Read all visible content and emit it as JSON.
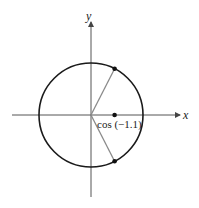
{
  "diagram": {
    "type": "unit-circle",
    "axes": {
      "x_label": "x",
      "y_label": "y"
    },
    "circle": {
      "center": [
        0,
        0
      ],
      "radius": 1
    },
    "points": [
      {
        "name": "upper-point",
        "angle": 1.1,
        "description": "point on circle at angle 1.1"
      },
      {
        "name": "lower-point",
        "angle": -1.1,
        "description": "point on circle at angle -1.1"
      },
      {
        "name": "cos-point",
        "x": 0.4536,
        "y": 0,
        "label": "cos (−1.1)"
      }
    ],
    "colors": {
      "axis": "#555555",
      "circle": "#1a1a1a",
      "radius_line": "#8a8a8a",
      "point": "#111111"
    }
  }
}
